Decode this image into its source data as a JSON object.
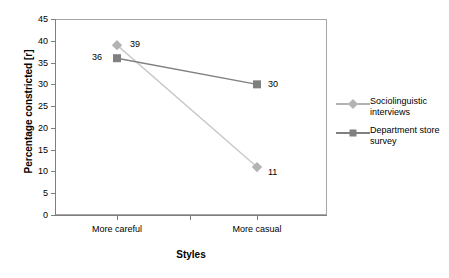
{
  "chart_data": {
    "type": "line",
    "title": "",
    "xlabel": "Styles",
    "ylabel": "Percentage constricted [r]",
    "categories": [
      "More careful",
      "More casual"
    ],
    "ylim": [
      0,
      45
    ],
    "yticks": [
      0,
      5,
      10,
      15,
      20,
      25,
      30,
      35,
      40,
      45
    ],
    "ytick_labels": [
      "0",
      "5",
      "10",
      "15",
      "20",
      "25",
      "30",
      "35",
      "40",
      "45"
    ],
    "grid": false,
    "legend_position": "right",
    "series": [
      {
        "name": "Sociolinguistic interviews",
        "marker": "diamond",
        "color": "#b3b3b3",
        "line_color": "#c9c9c9",
        "values": [
          39,
          11
        ],
        "data_labels": [
          "39",
          "11"
        ]
      },
      {
        "name": "Department store survey",
        "marker": "square",
        "color": "#808080",
        "line_color": "#808080",
        "values": [
          36,
          30
        ],
        "data_labels": [
          "36",
          "30"
        ]
      }
    ]
  },
  "axes": {
    "y_title": "Percentage constricted [r]",
    "x_title": "Styles",
    "y_tick_labels": [
      "45",
      "40",
      "35",
      "30",
      "25",
      "20",
      "15",
      "10",
      "5",
      "0"
    ],
    "x_tick_labels": [
      "More careful",
      "More casual"
    ]
  },
  "legend": {
    "items": [
      {
        "label_line1": "Sociolinguistic",
        "label_line2": "interviews",
        "marker": "diamond-marker",
        "color": "#b3b3b3"
      },
      {
        "label_line1": "Department store",
        "label_line2": "survey",
        "marker": "square-marker",
        "color": "#808080"
      }
    ]
  },
  "data_labels": {
    "s1_p1": "39",
    "s1_p2": "11",
    "s2_p1": "36",
    "s2_p2": "30"
  },
  "colors": {
    "series1": "#b3b3b3",
    "series1_line": "#c9c9c9",
    "series2": "#808080",
    "series2_line": "#808080",
    "axis": "#7f7f7f",
    "frame": "#a6a6a6"
  }
}
